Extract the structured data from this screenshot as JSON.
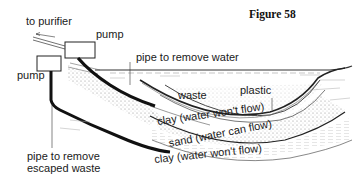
{
  "figure": {
    "title": "Figure 58"
  },
  "labels": {
    "to_purifier": "to purifier",
    "pump_upper": "pump",
    "pump_lower": "pump",
    "pipe_remove_water": "pipe to remove water",
    "waste": "waste",
    "plastic": "plastic",
    "clay_upper": "clay (water won't flow)",
    "sand": "sand (water can flow)",
    "clay_lower": "clay (water won't flow)",
    "pipe_remove_escaped_line1": "pipe to remove",
    "pipe_remove_escaped_line2": "escaped waste"
  },
  "colors": {
    "ink": "#1a1a1a",
    "background": "#ffffff",
    "stipple": "#777777"
  }
}
